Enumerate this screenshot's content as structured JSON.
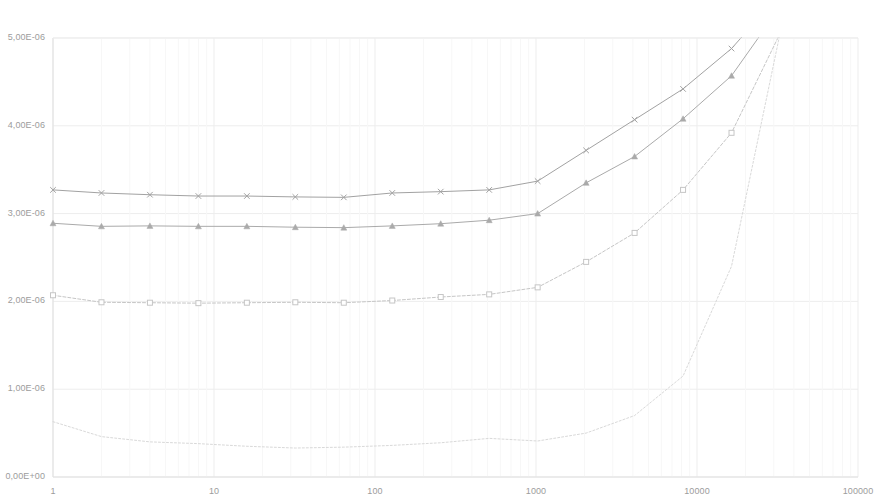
{
  "chart_data": {
    "type": "line",
    "title": "",
    "xlabel": "",
    "ylabel": "",
    "xscale": "log",
    "yscale": "linear",
    "grid": true,
    "legend_position": "top-center",
    "xlim": [
      1,
      100000
    ],
    "ylim": [
      0,
      5e-06
    ],
    "x_tick_labels": [
      "1",
      "10",
      "100",
      "1000",
      "10000",
      "100000"
    ],
    "x_ticks": [
      1,
      10,
      100,
      1000,
      10000,
      100000
    ],
    "y_tick_labels": [
      "0,00E+00",
      "1,00E-06",
      "2,00E-06",
      "3,00E-06",
      "4,00E-06",
      "5,00E-06"
    ],
    "y_ticks": [
      0,
      1e-06,
      2e-06,
      3e-06,
      4e-06,
      5e-06
    ],
    "x": [
      1,
      2,
      4,
      8,
      16,
      32,
      64,
      128,
      256,
      512,
      1024,
      2048,
      4096,
      8192,
      16384,
      32768
    ],
    "series": [
      {
        "name": "sx1",
        "color": "#d9d9d9",
        "marker": "none",
        "dash": "2 2",
        "values": [
          6.3e-07,
          4.6e-07,
          4e-07,
          3.8e-07,
          3.5e-07,
          3.3e-07,
          3.4e-07,
          3.6e-07,
          3.9e-07,
          4.4e-07,
          4.1e-07,
          5e-07,
          7e-07,
          1.15e-06,
          2.4e-06,
          5.05e-06
        ]
      },
      {
        "name": "pingoong",
        "color": "#c6c6c6",
        "marker": "square",
        "dash": "3 2",
        "values": [
          2.07e-06,
          1.99e-06,
          1.985e-06,
          1.98e-06,
          1.985e-06,
          1.99e-06,
          1.985e-06,
          2.01e-06,
          2.05e-06,
          2.08e-06,
          2.16e-06,
          2.45e-06,
          2.78e-06,
          3.27e-06,
          3.92e-06,
          5.05e-06
        ]
      },
      {
        "name": "pingping",
        "color": "#aaaaaa",
        "marker": "triangle",
        "dash": "",
        "values": [
          2.89e-06,
          2.855e-06,
          2.86e-06,
          2.855e-06,
          2.855e-06,
          2.845e-06,
          2.84e-06,
          2.86e-06,
          2.885e-06,
          2.925e-06,
          3e-06,
          3.35e-06,
          3.65e-06,
          4.08e-06,
          4.57e-06,
          5.35e-06
        ]
      },
      {
        "name": "pongpong",
        "color": "#a2a2a2",
        "marker": "x",
        "dash": "",
        "values": [
          3.27e-06,
          3.235e-06,
          3.215e-06,
          3.2e-06,
          3.2e-06,
          3.19e-06,
          3.185e-06,
          3.235e-06,
          3.25e-06,
          3.27e-06,
          3.37e-06,
          3.72e-06,
          4.07e-06,
          4.42e-06,
          4.88e-06,
          5.5e-06
        ]
      }
    ]
  },
  "legend": {
    "items": [
      {
        "label": "sx1"
      },
      {
        "label": "pingoong"
      },
      {
        "label": "pingping"
      },
      {
        "label": "pongpong"
      }
    ]
  },
  "axes": {
    "grid_color": "#ededed",
    "axis_color": "#e0e0e0",
    "tick_text_color": "#9c9c9c"
  }
}
